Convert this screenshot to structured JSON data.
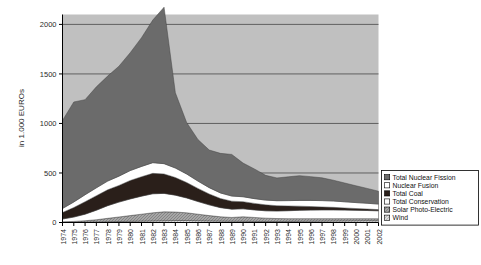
{
  "chart_data": {
    "type": "area",
    "title": "",
    "subtitle": "",
    "xlabel": "",
    "ylabel": "in 1.000 EUROs",
    "stacked": true,
    "grid": true,
    "legend_position": "right-bottom",
    "xlim": [
      1974,
      2002
    ],
    "ylim": [
      0,
      2100
    ],
    "yticks": [
      0,
      500,
      1000,
      1500,
      2000
    ],
    "ytick_labels": [
      "0",
      "500",
      "1000",
      "1500",
      "2000"
    ],
    "categories": [
      "1974",
      "1975",
      "1976",
      "1977",
      "1978",
      "1979",
      "1980",
      "1981",
      "1982",
      "1983",
      "1984",
      "1985",
      "1986",
      "1987",
      "1988",
      "1989",
      "1990",
      "1991",
      "1992",
      "1993",
      "1994",
      "1995",
      "1996",
      "1997",
      "1998",
      "1999",
      "2000",
      "2001",
      "2002"
    ],
    "series": [
      {
        "name": "Wind",
        "color": "#d8d8d8",
        "swatch": "light-grey-hatch",
        "values": [
          2,
          3,
          4,
          6,
          8,
          10,
          12,
          14,
          16,
          18,
          20,
          20,
          18,
          16,
          14,
          13,
          12,
          11,
          10,
          10,
          11,
          12,
          13,
          14,
          15,
          16,
          17,
          18,
          18
        ]
      },
      {
        "name": "Solar Photo-Electric",
        "color": "#9a9a9a",
        "swatch": "mid-grey-hatch",
        "values": [
          5,
          8,
          14,
          22,
          34,
          46,
          58,
          70,
          82,
          90,
          86,
          78,
          66,
          54,
          44,
          38,
          46,
          40,
          34,
          30,
          28,
          27,
          26,
          25,
          24,
          23,
          22,
          21,
          20
        ]
      },
      {
        "name": "Total Conservation",
        "color": "#ffffff",
        "swatch": "white",
        "values": [
          28,
          44,
          66,
          96,
          128,
          150,
          168,
          182,
          192,
          186,
          170,
          150,
          128,
          108,
          92,
          84,
          80,
          76,
          74,
          76,
          80,
          84,
          86,
          88,
          88,
          86,
          84,
          82,
          80
        ]
      },
      {
        "name": "Total Coal",
        "color": "#2a1f1a",
        "swatch": "near-black",
        "values": [
          66,
          96,
          126,
          146,
          160,
          168,
          186,
          196,
          206,
          196,
          178,
          156,
          132,
          110,
          92,
          80,
          72,
          66,
          60,
          54,
          48,
          42,
          36,
          30,
          26,
          22,
          18,
          15,
          12
        ]
      },
      {
        "name": "Nuclear Fusion",
        "color": "#ffffff",
        "swatch": "white",
        "values": [
          40,
          56,
          70,
          80,
          88,
          94,
          100,
          104,
          108,
          104,
          96,
          86,
          74,
          64,
          56,
          52,
          50,
          48,
          48,
          50,
          54,
          58,
          62,
          64,
          64,
          62,
          60,
          58,
          56
        ]
      },
      {
        "name": "Total Nuclear Fission",
        "color": "#6b6b6b",
        "swatch": "dark-grey",
        "values": [
          890,
          1010,
          960,
          1020,
          1060,
          1110,
          1190,
          1300,
          1440,
          1580,
          760,
          520,
          420,
          380,
          400,
          420,
          340,
          300,
          250,
          230,
          240,
          250,
          240,
          230,
          210,
          190,
          170,
          150,
          130
        ]
      }
    ],
    "stack_order_bottom_to_top": [
      "Wind",
      "Solar Photo-Electric",
      "Total Conservation",
      "Total Coal",
      "Nuclear Fusion",
      "Total Nuclear Fission"
    ],
    "peak": {
      "year": "1983",
      "value": 2070
    },
    "annotations": []
  },
  "legend": {
    "items": [
      {
        "label": "Total Nuclear Fission"
      },
      {
        "label": "Nuclear Fusion"
      },
      {
        "label": "Total Coal"
      },
      {
        "label": "Total Conservation"
      },
      {
        "label": "Solar Photo-Electric"
      },
      {
        "label": "Wind"
      }
    ]
  },
  "colors": {
    "plot_background": "#c0c0c0",
    "page_background": "#ffffff",
    "axis": "#000000",
    "gridline": "#555555",
    "legend_border": "#000000"
  }
}
